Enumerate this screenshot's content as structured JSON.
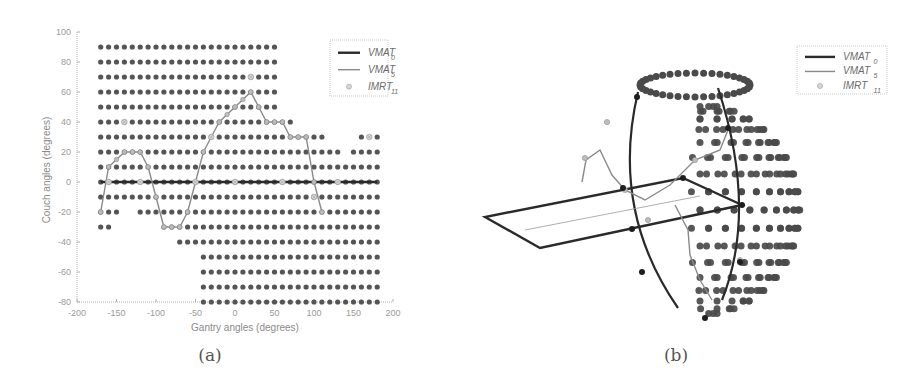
{
  "chart_data": [
    {
      "type": "scatter",
      "panel": "a",
      "caption": "(a)",
      "title": "",
      "xlabel": "Gantry angles (degrees)",
      "ylabel": "Couch angles (degrees)",
      "xlim": [
        -200,
        200
      ],
      "ylim": [
        -80,
        100
      ],
      "xticks": [
        -200,
        -150,
        -100,
        -50,
        0,
        50,
        100,
        150,
        200
      ],
      "yticks": [
        100,
        80,
        60,
        40,
        20,
        0,
        -20,
        -40,
        -60,
        -80
      ],
      "grid": false,
      "legend_position": "upper right",
      "legend": [
        {
          "label": "VMAT",
          "sub": "0",
          "style": "thick-solid"
        },
        {
          "label": "VMAT",
          "sub": "5",
          "style": "thin-line"
        },
        {
          "label": "IMRT",
          "sub": "11",
          "style": "marker"
        }
      ],
      "grid_points": {
        "description": "Feasible candidate beam directions (dark dots), 10 degree spacing",
        "rows": [
          {
            "couch": 90,
            "gantry_range": [
              -170,
              50
            ]
          },
          {
            "couch": 80,
            "gantry_range": [
              -170,
              50
            ]
          },
          {
            "couch": 70,
            "gantry_range": [
              -170,
              50
            ]
          },
          {
            "couch": 60,
            "gantry_range": [
              -170,
              50
            ]
          },
          {
            "couch": 50,
            "gantry_range": [
              -170,
              50
            ]
          },
          {
            "couch": 40,
            "gantry_range": [
              -170,
              70
            ]
          },
          {
            "couch": 30,
            "gantry_range": [
              -170,
              110
            ],
            "extra": [
              160,
              180
            ]
          },
          {
            "couch": 20,
            "gantry_range": [
              -170,
              130
            ],
            "extra_range": [
              150,
              180
            ]
          },
          {
            "couch": 10,
            "gantry_range": [
              -170,
              180
            ]
          },
          {
            "couch": 0,
            "gantry_range": [
              -170,
              180
            ]
          },
          {
            "couch": -10,
            "gantry_range": [
              -170,
              180
            ]
          },
          {
            "couch": -20,
            "gantry_range": [
              -170,
              -150
            ],
            "extra_range": [
              -120,
              180
            ]
          },
          {
            "couch": -30,
            "gantry_range": [
              -170,
              -160
            ],
            "extra_range": [
              -90,
              180
            ]
          },
          {
            "couch": -40,
            "gantry_range": [
              -70,
              180
            ]
          },
          {
            "couch": -50,
            "gantry_range": [
              -40,
              180
            ]
          },
          {
            "couch": -60,
            "gantry_range": [
              -40,
              180
            ]
          },
          {
            "couch": -70,
            "gantry_range": [
              -40,
              180
            ]
          },
          {
            "couch": -80,
            "gantry_range": [
              -40,
              180
            ]
          }
        ]
      },
      "series": [
        {
          "name": "VMAT_0",
          "x": [
            -170,
            180
          ],
          "y": [
            0,
            0
          ]
        },
        {
          "name": "VMAT_5",
          "x": [
            -170,
            -160,
            -150,
            -140,
            -130,
            -120,
            -110,
            -100,
            -90,
            -80,
            -70,
            -60,
            -50,
            -40,
            -30,
            -20,
            -10,
            0,
            10,
            20,
            30,
            40,
            50,
            60,
            70,
            80,
            90,
            100,
            110
          ],
          "y": [
            -20,
            10,
            15,
            20,
            20,
            20,
            10,
            -10,
            -30,
            -30,
            -30,
            -20,
            0,
            20,
            30,
            40,
            45,
            50,
            55,
            60,
            50,
            40,
            40,
            40,
            30,
            30,
            30,
            0,
            -20
          ]
        },
        {
          "name": "IMRT_11",
          "x": [
            -160,
            -140,
            -120,
            -50,
            -30,
            0,
            20,
            60,
            100,
            130,
            170
          ],
          "y": [
            0,
            40,
            0,
            0,
            30,
            0,
            70,
            0,
            -10,
            0,
            30
          ]
        }
      ]
    },
    {
      "type": "scatter",
      "panel": "b",
      "caption": "(b)",
      "description": "3D sphere view of candidate beam directions with VMAT_0 trajectory (thick great-circle arcs and couch plane) and VMAT_5 path (thin lighter line)",
      "legend_position": "upper right",
      "legend": [
        {
          "label": "VMAT",
          "sub": "0",
          "style": "thick-solid"
        },
        {
          "label": "VMAT",
          "sub": "5",
          "style": "thin-line"
        },
        {
          "label": "IMRT",
          "sub": "11",
          "style": "marker"
        }
      ]
    }
  ],
  "colors": {
    "dot": "#555555",
    "vmat0": "#2a2a2a",
    "vmat5": "#8a8a8a",
    "imrt": "#c8c8c8",
    "axis": "#b0b0b0"
  }
}
